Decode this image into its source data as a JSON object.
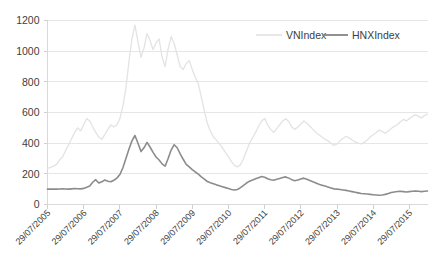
{
  "chart_data": {
    "type": "line",
    "title": "",
    "xlabel": "",
    "ylabel": "",
    "ylim": [
      0,
      1200
    ],
    "y_ticks": [
      "0",
      "200",
      "400",
      "600",
      "800",
      "1000",
      "1200"
    ],
    "y_tick_values": [
      0,
      200,
      400,
      600,
      800,
      1000,
      1200
    ],
    "grid": true,
    "legend_position": "top-right",
    "x_tick_labels": [
      "29/07/2005",
      "29/07/2006",
      "29/07/2007",
      "29/07/2008",
      "29/07/2009",
      "29/07/2010",
      "29/07/2011",
      "29/07/2012",
      "29/07/2013",
      "29/07/2014",
      "29/07/2015"
    ],
    "x_tick_positions": [
      0,
      12,
      24,
      36,
      48,
      60,
      72,
      84,
      96,
      108,
      120
    ],
    "x_range": [
      0,
      126
    ],
    "series": [
      {
        "name": "VNIndex",
        "color": "#e3e3e3",
        "stroke_width": 1.3,
        "values": [
          236,
          242,
          250,
          262,
          290,
          310,
          352,
          390,
          430,
          470,
          500,
          480,
          520,
          560,
          545,
          505,
          470,
          440,
          425,
          455,
          490,
          520,
          505,
          520,
          560,
          640,
          760,
          930,
          1080,
          1170,
          1060,
          960,
          1020,
          1115,
          1070,
          1010,
          1055,
          1080,
          960,
          900,
          1015,
          1095,
          1050,
          975,
          900,
          880,
          920,
          940,
          880,
          830,
          790,
          700,
          610,
          530,
          480,
          440,
          420,
          395,
          370,
          340,
          310,
          280,
          255,
          245,
          260,
          300,
          350,
          400,
          435,
          470,
          510,
          545,
          560,
          520,
          490,
          470,
          495,
          520,
          545,
          560,
          540,
          505,
          490,
          505,
          525,
          545,
          530,
          510,
          490,
          470,
          455,
          440,
          425,
          415,
          400,
          385,
          395,
          415,
          430,
          445,
          435,
          420,
          408,
          400,
          395,
          405,
          420,
          440,
          455,
          470,
          485,
          475,
          465,
          480,
          495,
          510,
          520,
          540,
          555,
          545,
          560,
          575,
          585,
          575,
          565,
          580,
          590
        ]
      },
      {
        "name": "HNXIndex",
        "color": "#8c8c8c",
        "stroke_width": 1.6,
        "values": [
          100,
          100,
          101,
          100,
          101,
          102,
          101,
          100,
          102,
          104,
          103,
          102,
          105,
          112,
          120,
          145,
          162,
          140,
          148,
          160,
          152,
          148,
          158,
          172,
          195,
          240,
          300,
          360,
          415,
          450,
          400,
          345,
          370,
          405,
          375,
          340,
          310,
          290,
          265,
          250,
          300,
          355,
          390,
          370,
          330,
          295,
          262,
          245,
          228,
          212,
          198,
          180,
          165,
          150,
          142,
          135,
          128,
          122,
          116,
          110,
          104,
          98,
          95,
          98,
          110,
          125,
          140,
          152,
          160,
          168,
          175,
          182,
          178,
          168,
          162,
          158,
          164,
          170,
          176,
          180,
          172,
          162,
          155,
          160,
          166,
          172,
          165,
          156,
          148,
          140,
          132,
          126,
          120,
          114,
          108,
          102,
          100,
          98,
          95,
          92,
          88,
          84,
          80,
          76,
          72,
          70,
          68,
          66,
          64,
          62,
          60,
          62,
          66,
          72,
          78,
          82,
          85,
          86,
          84,
          82,
          84,
          86,
          88,
          86,
          84,
          86,
          88
        ]
      }
    ]
  },
  "legend": {
    "items": [
      {
        "label": "VNIndex",
        "color": "#e3e3e3"
      },
      {
        "label": "HNXIndex",
        "color": "#8c8c8c"
      }
    ]
  }
}
